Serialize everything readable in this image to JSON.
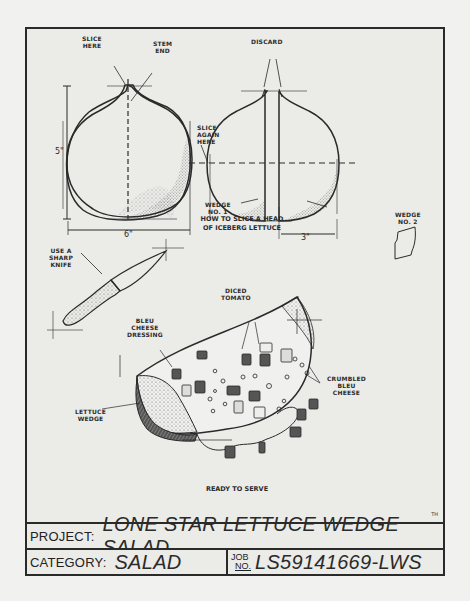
{
  "sheet": {
    "title_block": {
      "project_key": "PROJECT:",
      "project_value": "LONE STAR LETTUCE WEDGE SALAD",
      "category_key": "CATEGORY:",
      "category_value": "SALAD",
      "job_key_top": "JOB",
      "job_key_bottom": "NO.",
      "job_value": "LS59141669-LWS"
    },
    "initials": "TH",
    "figure1": {
      "caption_line1": "HOW TO SLICE A HEAD",
      "caption_line2": "OF ICEBERG LETTUCE",
      "labels": {
        "slice_here_1": "SLICE",
        "slice_here_2": "HERE",
        "stem_end_1": "STEM",
        "stem_end_2": "END",
        "height_dim": "5\"",
        "width_dim": "6\"",
        "discard": "DISCARD",
        "slice_again_1": "SLICE",
        "slice_again_2": "AGAIN",
        "slice_again_3": "HERE",
        "wedge1_1": "WEDGE",
        "wedge1_2": "NO. 1",
        "wedge2_1": "WEDGE",
        "wedge2_2": "NO. 2",
        "half_width_dim": "3\""
      }
    },
    "figure2": {
      "knife_1": "USE A",
      "knife_2": "SHARP",
      "knife_3": "KNIFE"
    },
    "figure3": {
      "caption": "READY TO SERVE",
      "labels": {
        "tomato_1": "DICED",
        "tomato_2": "TOMATO",
        "dressing_1": "BLEU",
        "dressing_2": "CHEESE",
        "dressing_3": "DRESSING",
        "crumbled_1": "CRUMBLED",
        "crumbled_2": "BLEU",
        "crumbled_3": "CHEESE",
        "wedge_1": "LETTUCE",
        "wedge_2": "WEDGE"
      }
    }
  }
}
